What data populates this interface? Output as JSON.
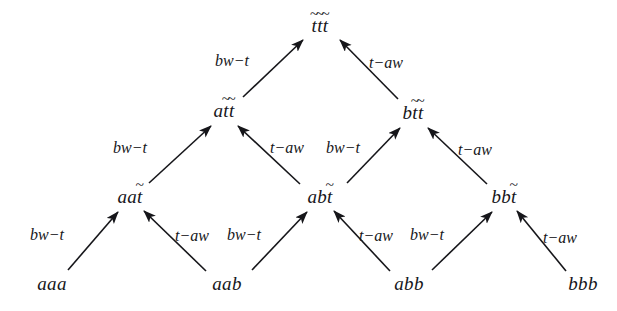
{
  "figure": {
    "kind": "rewriting-lattice-diagram",
    "background_color": "#ffffff",
    "text_color": "#16161a",
    "width": 617,
    "height": 311
  },
  "labels": {
    "bw_t": "bw−t",
    "t_aw": "t−aw",
    "tilde": "~"
  },
  "nodes": [
    {
      "id": "aaa",
      "base": "aaa",
      "tildes": [
        0,
        0,
        0
      ],
      "x": 52,
      "y": 283,
      "level": 0
    },
    {
      "id": "aab",
      "base": "aab",
      "tildes": [
        0,
        0,
        0
      ],
      "x": 227,
      "y": 283,
      "level": 0
    },
    {
      "id": "abb",
      "base": "abb",
      "tildes": [
        0,
        0,
        0
      ],
      "x": 409,
      "y": 283,
      "level": 0
    },
    {
      "id": "bbb",
      "base": "bbb",
      "tildes": [
        0,
        0,
        0
      ],
      "x": 583,
      "y": 283,
      "level": 0
    },
    {
      "id": "aat",
      "base": "aat",
      "tildes": [
        0,
        0,
        1
      ],
      "x": 130,
      "y": 196,
      "level": 1
    },
    {
      "id": "abt",
      "base": "abt",
      "tildes": [
        0,
        0,
        1
      ],
      "x": 320,
      "y": 196,
      "level": 1
    },
    {
      "id": "bbt",
      "base": "bbt",
      "tildes": [
        0,
        0,
        1
      ],
      "x": 504,
      "y": 196,
      "level": 1
    },
    {
      "id": "att",
      "base": "att",
      "tildes": [
        0,
        1,
        1
      ],
      "x": 224,
      "y": 110,
      "level": 2
    },
    {
      "id": "btt",
      "base": "btt",
      "tildes": [
        0,
        1,
        1
      ],
      "x": 413,
      "y": 112,
      "level": 2
    },
    {
      "id": "ttt",
      "base": "ttt",
      "tildes": [
        1,
        1,
        1
      ],
      "x": 320,
      "y": 25,
      "level": 3
    }
  ],
  "edges": [
    {
      "from": "aaa",
      "to": "aat",
      "rule": "bw−t",
      "x1": 68,
      "y1": 270,
      "x2": 118,
      "y2": 212,
      "label_x": 47,
      "label_y": 235
    },
    {
      "from": "aab",
      "to": "aat",
      "rule": "t−aw",
      "x1": 206,
      "y1": 271,
      "x2": 144,
      "y2": 211,
      "label_x": 192,
      "label_y": 236
    },
    {
      "from": "aab",
      "to": "abt",
      "rule": "bw−t",
      "x1": 252,
      "y1": 270,
      "x2": 307,
      "y2": 212,
      "label_x": 244,
      "label_y": 235
    },
    {
      "from": "abb",
      "to": "abt",
      "rule": "t−aw",
      "x1": 390,
      "y1": 271,
      "x2": 334,
      "y2": 211,
      "label_x": 376,
      "label_y": 236
    },
    {
      "from": "abb",
      "to": "bbt",
      "rule": "bw−t",
      "x1": 432,
      "y1": 270,
      "x2": 492,
      "y2": 212,
      "label_x": 427,
      "label_y": 235
    },
    {
      "from": "bbb",
      "to": "bbt",
      "rule": "t−aw",
      "x1": 566,
      "y1": 271,
      "x2": 517,
      "y2": 211,
      "label_x": 560,
      "label_y": 238
    },
    {
      "from": "aat",
      "to": "att",
      "rule": "bw−t",
      "x1": 149,
      "y1": 183,
      "x2": 211,
      "y2": 126,
      "label_x": 130,
      "label_y": 148
    },
    {
      "from": "abt",
      "to": "att",
      "rule": "t−aw",
      "x1": 300,
      "y1": 184,
      "x2": 238,
      "y2": 126,
      "label_x": 287,
      "label_y": 148
    },
    {
      "from": "abt",
      "to": "btt",
      "rule": "bw−t",
      "x1": 347,
      "y1": 183,
      "x2": 400,
      "y2": 128,
      "label_x": 343,
      "label_y": 148
    },
    {
      "from": "bbt",
      "to": "btt",
      "rule": "t−aw",
      "x1": 487,
      "y1": 184,
      "x2": 428,
      "y2": 128,
      "label_x": 475,
      "label_y": 150
    },
    {
      "from": "att",
      "to": "ttt",
      "rule": "bw−t",
      "x1": 243,
      "y1": 97,
      "x2": 303,
      "y2": 40,
      "label_x": 232,
      "label_y": 61
    },
    {
      "from": "btt",
      "to": "ttt",
      "rule": "t−aw",
      "x1": 398,
      "y1": 99,
      "x2": 340,
      "y2": 40,
      "label_x": 386,
      "label_y": 63
    }
  ]
}
